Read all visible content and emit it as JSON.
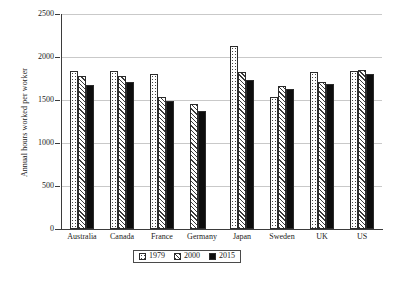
{
  "chart_data": {
    "type": "bar",
    "title": "",
    "xlabel": "",
    "ylabel": "Annual hours worked per worker",
    "ylim": [
      0,
      2500
    ],
    "yticks": [
      0,
      500,
      1000,
      1500,
      2000,
      2500
    ],
    "ytick_labels": [
      "0",
      "500",
      "1000",
      "1500",
      "2000",
      "2500"
    ],
    "grid": true,
    "legend_position": "bottom",
    "categories": [
      "Australia",
      "Canada",
      "France",
      "Germany",
      "Japan",
      "Sweden",
      "UK",
      "US"
    ],
    "series": [
      {
        "name": "1979",
        "pattern": "dotted",
        "values": [
          1832,
          1840,
          1805,
          null,
          2128,
          1540,
          1830,
          1840
        ]
      },
      {
        "name": "2000",
        "pattern": "hatched",
        "values": [
          1780,
          1780,
          1530,
          1455,
          1830,
          1660,
          1710,
          1850
        ]
      },
      {
        "name": "2015",
        "pattern": "solid-black",
        "values": [
          1680,
          1710,
          1490,
          1370,
          1735,
          1625,
          1685,
          1805
        ]
      }
    ]
  },
  "legend": {
    "items": [
      {
        "label": "1979",
        "pattern": "dotted"
      },
      {
        "label": "2000",
        "pattern": "hatched"
      },
      {
        "label": "2015",
        "pattern": "solid-black"
      }
    ]
  },
  "colors": {
    "axis": "#3b3b3b",
    "grid": "#c9c9c9",
    "bar_outline": "#2b2b2b",
    "series_2015_fill": "#0d0d0d",
    "background": "#ffffff"
  }
}
